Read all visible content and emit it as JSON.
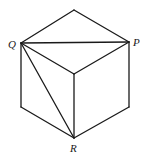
{
  "diagram": {
    "type": "cube",
    "labels": {
      "Q": "Q",
      "P": "P",
      "R": "R"
    },
    "vertices": {
      "top": [
        74,
        10
      ],
      "Q": [
        21,
        43
      ],
      "P": [
        129,
        42
      ],
      "center": [
        74,
        74
      ],
      "bottom_left": [
        21,
        107
      ],
      "bottom_right": [
        129,
        107
      ],
      "R": [
        74,
        138
      ]
    },
    "diagonals": [
      "Q-P",
      "Q-R"
    ],
    "line_color": "#1a1a1a"
  }
}
